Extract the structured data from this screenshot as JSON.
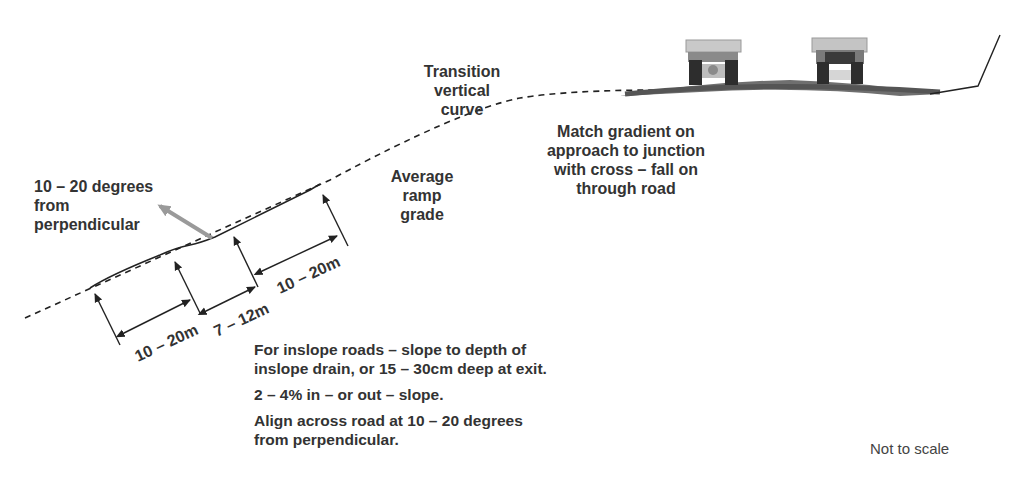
{
  "labels": {
    "transition_curve": [
      "Transition vertical",
      "curve"
    ],
    "match_gradient": [
      "Match gradient on",
      "approach to junction",
      "with cross – fall on",
      "through road"
    ],
    "average_ramp": [
      "Average",
      "ramp",
      "grade"
    ],
    "degrees": [
      "10 – 20 degrees",
      "from",
      "perpendicular"
    ],
    "not_to_scale": "Not to scale"
  },
  "dimensions": {
    "d1": "10 – 20m",
    "d2": "7 – 12m",
    "d3": "10 – 20m"
  },
  "notes": [
    [
      "For inslope roads  –  slope to depth of",
      "inslope drain, or 15 – 30cm deep at exit."
    ],
    [
      "2 – 4% in – or out – slope."
    ],
    [
      "Align across road at 10 – 20 degrees",
      "from perpendicular."
    ]
  ],
  "colors": {
    "line": "#222222",
    "road": "#6f6f6f",
    "arrow_grey": "#9a9a9a"
  }
}
